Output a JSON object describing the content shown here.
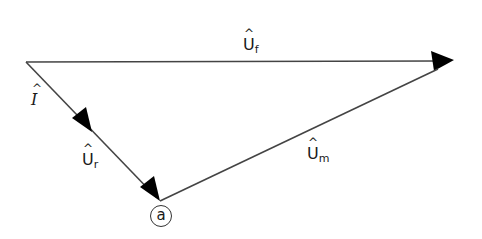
{
  "diagram": {
    "type": "phasor-diagram",
    "vectors": [
      {
        "id": "I",
        "label": "I",
        "subscript": "",
        "from": [
          26,
          62
        ],
        "to": [
          94,
          131
        ]
      },
      {
        "id": "Ur",
        "label": "U",
        "subscript": "r",
        "from": [
          94,
          131
        ],
        "to": [
          160,
          201
        ]
      },
      {
        "id": "Um",
        "label": "U",
        "subscript": "m",
        "from": [
          160,
          201
        ],
        "to": [
          454,
          60
        ]
      },
      {
        "id": "Uf",
        "label": "U",
        "subscript": "f",
        "from": [
          26,
          62
        ],
        "to": [
          454,
          60
        ]
      }
    ],
    "labels": {
      "I": {
        "text": "I",
        "sub": ""
      },
      "Ur": {
        "text": "U",
        "sub": "r"
      },
      "Um": {
        "text": "U",
        "sub": "m"
      },
      "Uf": {
        "text": "U",
        "sub": "f"
      }
    },
    "point_marker": {
      "text": "a"
    },
    "colors": {
      "line": "#333333",
      "arrow": "#000000",
      "text": "#1a1a1a"
    }
  }
}
